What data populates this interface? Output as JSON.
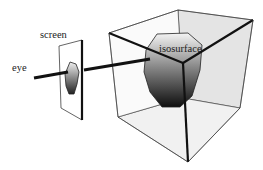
{
  "diagram": {
    "labels": {
      "eye": "eye",
      "screen": "screen",
      "isosurface": "isosurface"
    },
    "colors": {
      "line": "#111111",
      "face_light": "#eeeeee",
      "face_mid": "#dcdcdc",
      "iso_top": "#f2f2f2",
      "iso_bottom": "#111111"
    }
  }
}
